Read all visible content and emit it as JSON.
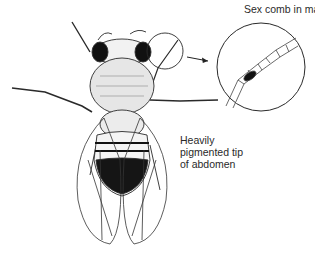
{
  "diagram": {
    "labels": {
      "sex_comb": "Sex comb in male",
      "abdomen_line1": "Heavily",
      "abdomen_line2": "pigmented tip",
      "abdomen_line3": "of abdomen"
    },
    "callouts": [
      {
        "name": "foreleg-highlight-circle",
        "target": "inset-magnified-leg"
      },
      {
        "name": "abdomen-tip",
        "label_ref": "abdomen"
      }
    ],
    "colors": {
      "ink": "#1e1e1e",
      "pigment": "#151515",
      "paper": "#ffffff"
    }
  }
}
